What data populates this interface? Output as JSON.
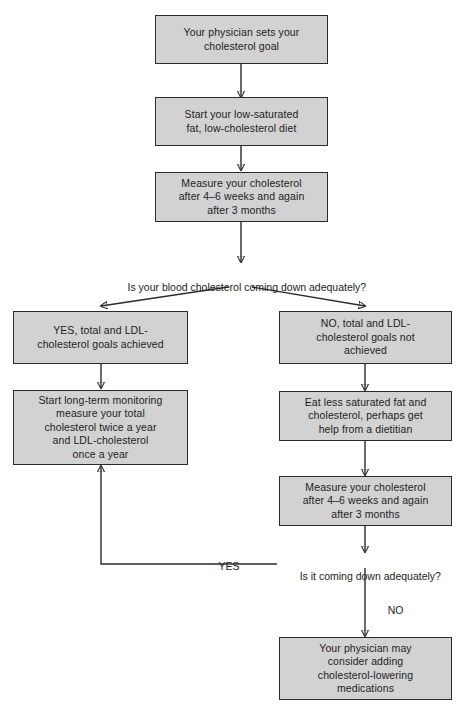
{
  "diagram": {
    "box_fill": "#d2d2d2",
    "box_border": "#2b2b2b",
    "line_color": "#2b2b2b",
    "background": "#ffffff"
  },
  "nodes": {
    "set_goal": "Your physician sets your\ncholesterol goal",
    "start_diet": "Start your low-saturated\nfat, low-cholesterol diet",
    "measure_first": "Measure your cholesterol\nafter 4–6 weeks and again\nafter 3 months",
    "yes_goals_achieved": "YES, total and LDL-\ncholesterol goals achieved",
    "long_term_monitoring": "Start long-term monitoring\nmeasure your total\ncholesterol twice a year\nand LDL-cholesterol\nonce a year",
    "no_goals_not_achieved": "NO, total and LDL-\ncholesterol goals not\nachieved",
    "eat_less_fat": "Eat less saturated fat and\ncholesterol, perhaps get\nhelp from a dietitian",
    "measure_second": "Measure your cholesterol\nafter 4–6 weeks and again\nafter 3 months",
    "medications": "Your physician may\nconsider adding\ncholesterol-lowering\nmedications"
  },
  "decisions": {
    "first_question": "Is your blood cholesterol coming down adequately?",
    "second_question": "Is it coming down adequately?"
  },
  "edge_labels": {
    "yes_loop": "YES",
    "no_branch": "NO"
  }
}
